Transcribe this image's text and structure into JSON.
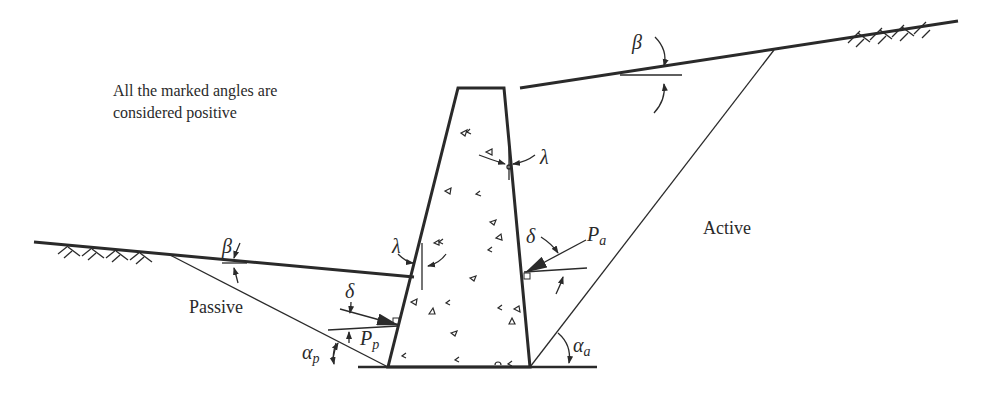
{
  "note": {
    "line1": "All the marked angles are",
    "line2": "considered positive"
  },
  "regions": {
    "passive": "Passive",
    "active": "Active"
  },
  "symbols": {
    "beta_top": "β",
    "beta_left": "β",
    "lambda_top": "λ",
    "lambda_left": "λ",
    "delta_active": "δ",
    "delta_passive": "δ",
    "Pa_main": "P",
    "Pa_sub": "a",
    "Pp_main": "P",
    "Pp_sub": "p",
    "alpha_a_main": "α",
    "alpha_a_sub": "a",
    "alpha_p_main": "α",
    "alpha_p_sub": "p"
  },
  "colors": {
    "ink": "#2a2a2a",
    "background": "#ffffff"
  }
}
